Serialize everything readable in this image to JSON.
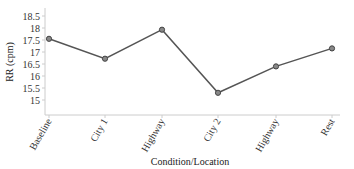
{
  "chart_data": {
    "type": "line",
    "title": "",
    "xlabel": "Condition/Location",
    "ylabel": "RR (cpm)",
    "categories": [
      "Baseline",
      "City 1",
      "Highway",
      "City 2",
      "Highway",
      "Rest"
    ],
    "series": [
      {
        "name": "RR",
        "values": [
          17.55,
          16.72,
          17.93,
          15.3,
          16.4,
          17.15
        ],
        "color": "#555555"
      }
    ],
    "yticks": [
      "15",
      "15.5",
      "16",
      "16.5",
      "17",
      "17.5",
      "18",
      "18.5"
    ],
    "ylim": [
      14.7,
      18.7
    ],
    "grid": false,
    "legend": null
  }
}
